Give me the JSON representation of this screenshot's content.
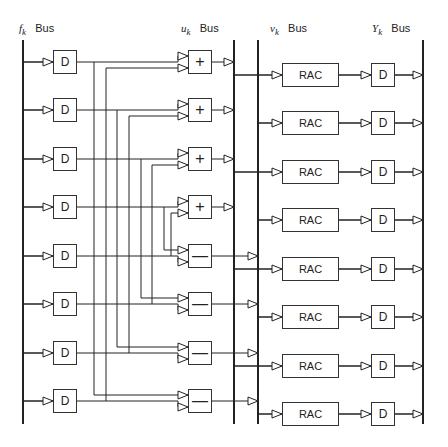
{
  "diagram": {
    "type": "block-diagram",
    "buses": [
      {
        "id": "f",
        "symbol": "f",
        "subscript": "k",
        "label": "Bus"
      },
      {
        "id": "u",
        "symbol": "u",
        "subscript": "k",
        "label": "Bus"
      },
      {
        "id": "v",
        "symbol": "v",
        "subscript": "k",
        "label": "Bus"
      },
      {
        "id": "Y",
        "symbol": "Y",
        "subscript": "k",
        "label": "Bus"
      }
    ],
    "input_delays": [
      "D",
      "D",
      "D",
      "D",
      "D",
      "D",
      "D",
      "D"
    ],
    "operators": [
      "+",
      "+",
      "+",
      "+",
      "—",
      "—",
      "—",
      "—"
    ],
    "rac_blocks": [
      "RAC",
      "RAC",
      "RAC",
      "RAC",
      "RAC",
      "RAC",
      "RAC",
      "RAC"
    ],
    "output_delays": [
      "D",
      "D",
      "D",
      "D",
      "D",
      "D",
      "D",
      "D"
    ],
    "butterfly_pairs": [
      [
        0,
        7
      ],
      [
        1,
        6
      ],
      [
        2,
        5
      ],
      [
        3,
        4
      ]
    ],
    "rac_source_bus": [
      "u",
      "v",
      "u",
      "v",
      "u",
      "v",
      "u",
      "v"
    ],
    "colors": {
      "line": "#222222",
      "background": "#ffffff"
    }
  }
}
